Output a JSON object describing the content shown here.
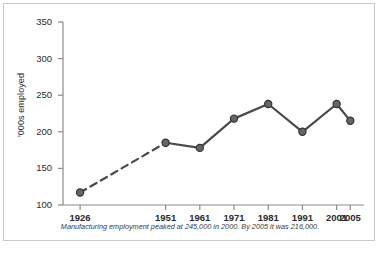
{
  "chart_data": {
    "type": "line",
    "title": "",
    "subtitle": "",
    "xlabel": "",
    "ylabel": "'000s employed",
    "categories": [
      "1926",
      "1951",
      "1961",
      "1971",
      "1981",
      "1991",
      "2001",
      "2005"
    ],
    "x": [
      1926,
      1951,
      1961,
      1971,
      1981,
      1991,
      2001,
      2005
    ],
    "values": [
      117,
      185,
      178,
      218,
      238,
      200,
      238,
      215
    ],
    "series": [
      {
        "name": "Manufacturing employment",
        "values": [
          117,
          185,
          178,
          218,
          238,
          200,
          238,
          215
        ]
      }
    ],
    "ylim": [
      100,
      350
    ],
    "xlim": [
      1921,
      2009
    ],
    "yticks": [
      100,
      150,
      200,
      250,
      300,
      350
    ],
    "ytick_labels": [
      "100",
      "150",
      "200",
      "250",
      "300",
      "350"
    ],
    "xticks": [
      1926,
      1951,
      1961,
      1971,
      1981,
      1991,
      2001,
      2005
    ],
    "xtick_labels": [
      "1926",
      "1951",
      "1961",
      "1971",
      "1981",
      "1991",
      "2001",
      "2005"
    ],
    "grid": false,
    "legend": "none",
    "dashed_segments": [
      [
        1926,
        1951
      ]
    ],
    "marker": "circle",
    "line_color": "#4a4a4a",
    "marker_color": "#666666",
    "marker_edge_color": "#333333",
    "axis_color": "#8a8a8a"
  },
  "caption": {
    "text": "Manufacturing employment peaked at 245,000 in 2000. By 2005 it was 216,000."
  },
  "undercaption": {
    "text": ""
  },
  "colors": {
    "frame_border": "#c9c9c9",
    "background": "#ffffff",
    "text": "#2b2b2b"
  }
}
